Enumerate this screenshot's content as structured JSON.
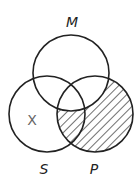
{
  "diagram": {
    "type": "venn",
    "sets": [
      {
        "name": "M",
        "label": "M"
      },
      {
        "name": "S",
        "label": "S"
      },
      {
        "name": "P",
        "label": "P"
      }
    ],
    "shaded_region": "P minus M",
    "marks": [
      {
        "label": "X",
        "region": "S only"
      }
    ],
    "colors": {
      "stroke": "#222222",
      "hatch": "#333333",
      "mark": "#666666"
    }
  }
}
